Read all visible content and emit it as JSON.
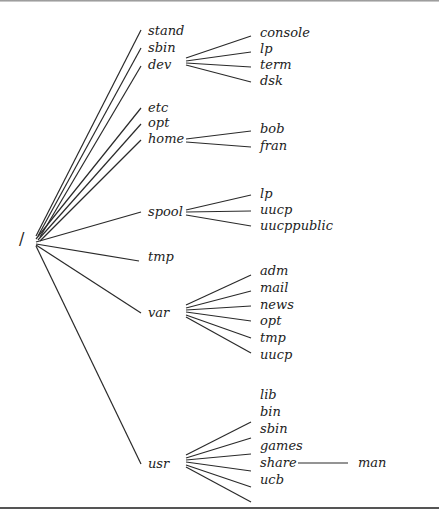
{
  "diagram": {
    "type": "directory-tree",
    "root": "/",
    "level1": [
      {
        "name": "stand",
        "children": []
      },
      {
        "name": "sbin",
        "children": []
      },
      {
        "name": "dev",
        "children": [
          "console",
          "lp",
          "term",
          "dsk"
        ]
      },
      {
        "name": "etc",
        "children": []
      },
      {
        "name": "opt",
        "children": []
      },
      {
        "name": "home",
        "children": [
          "bob",
          "fran"
        ]
      },
      {
        "name": "spool",
        "children": [
          "lp",
          "uucp",
          "uucppublic"
        ]
      },
      {
        "name": "tmp",
        "children": []
      },
      {
        "name": "var",
        "children": [
          "adm",
          "mail",
          "news",
          "opt",
          "tmp",
          "uucp"
        ]
      },
      {
        "name": "usr",
        "children": [
          "lib",
          "bin",
          "sbin",
          "games",
          "share",
          "ucb"
        ]
      }
    ],
    "level3": {
      "parent": "usr/share",
      "name": "man"
    }
  },
  "labels": {
    "root": "/",
    "stand": "stand",
    "sbin": "sbin",
    "dev": "dev",
    "dev_console": "console",
    "dev_lp": "lp",
    "dev_term": "term",
    "dev_dsk": "dsk",
    "etc": "etc",
    "opt": "opt",
    "home": "home",
    "home_bob": "bob",
    "home_fran": "fran",
    "spool": "spool",
    "spool_lp": "lp",
    "spool_uucp": "uucp",
    "spool_uucppublic": "uucppublic",
    "tmp": "tmp",
    "var": "var",
    "var_adm": "adm",
    "var_mail": "mail",
    "var_news": "news",
    "var_opt": "opt",
    "var_tmp": "tmp",
    "var_uucp": "uucp",
    "usr": "usr",
    "usr_lib": "lib",
    "usr_bin": "bin",
    "usr_sbin": "sbin",
    "usr_games": "games",
    "usr_share": "share",
    "usr_ucb": "ucb",
    "share_man": "man"
  }
}
